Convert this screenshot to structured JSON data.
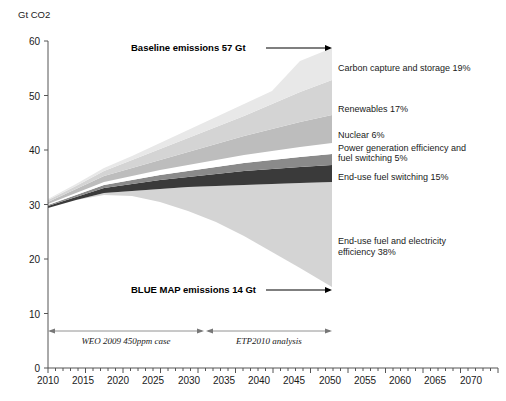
{
  "chart_data": {
    "type": "area",
    "title": "",
    "xlabel": "",
    "ylabel": "Gt CO2",
    "xlim": [
      2010,
      2070
    ],
    "ylim": [
      0,
      60
    ],
    "grid": false,
    "legend_position": "right-inline-labels",
    "x_ticks": [
      "2010",
      "2015",
      "2020",
      "2025",
      "2030",
      "2035",
      "2040",
      "2045",
      "2050",
      "2055",
      "2060",
      "2065",
      "2070"
    ],
    "y_ticks": [
      "0",
      "10",
      "20",
      "30",
      "40",
      "50",
      "60"
    ],
    "x_minor_tick_step": 1,
    "x": [
      2010,
      2050
    ],
    "baseline_emissions": [
      29,
      57
    ],
    "blue_map_emissions": [
      29,
      14
    ],
    "series": [
      {
        "name": "Carbon capture and storage",
        "share_percent": 19,
        "label": "Carbon capture and storage 19%",
        "color": "#d4d4d4",
        "values_2050_gt": 8.17
      },
      {
        "name": "Renewables",
        "share_percent": 17,
        "label": "Renewables 17%",
        "color": "#bdbdbd",
        "values_2050_gt": 7.31
      },
      {
        "name": "Nuclear",
        "share_percent": 6,
        "label": "Nuclear 6%",
        "color": "#ffffff",
        "values_2050_gt": 2.58
      },
      {
        "name": "Power generation efficiency and fuel switching",
        "share_percent": 5,
        "label": "Power generation efficiency  and fuel switching 5%",
        "color": "#8a8a8a",
        "values_2050_gt": 2.15
      },
      {
        "name": "End-use fuel switching",
        "share_percent": 15,
        "label": "End-use fuel switching 15%",
        "color": "#3a3a3a",
        "values_2050_gt": 6.45
      },
      {
        "name": "End-use fuel and electricity efficiency",
        "share_percent": 38,
        "label": "End-use fuel and electricity efficiency 38%",
        "color": "#d4d4d4",
        "values_2050_gt": 16.34
      }
    ],
    "annotations": [
      {
        "id": "baseline",
        "text": "Baseline emissions 57 Gt",
        "value_gt": 57,
        "style": "bold-with-arrow"
      },
      {
        "id": "bluemap",
        "text": "BLUE MAP emissions 14 Gt",
        "value_gt": 14,
        "style": "bold-with-arrow"
      },
      {
        "id": "period-left",
        "text": "WEO 2009 450ppm case",
        "range": [
          2010,
          2030
        ],
        "style": "italic-range"
      },
      {
        "id": "period-right",
        "text": "ETP2010 analysis",
        "range": [
          2030,
          2050
        ],
        "style": "italic-range"
      }
    ]
  },
  "axis": {
    "y_title": "Gt CO2"
  }
}
